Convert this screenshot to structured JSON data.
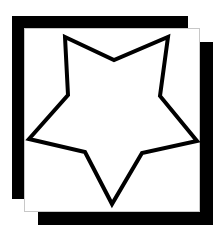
{
  "canvas": {
    "width": 220,
    "height": 235,
    "background": "#ffffff"
  },
  "colors": {
    "frame": "#000000",
    "panel": "#ffffff",
    "panel_outline": "#c8c8c8",
    "star_fill": "#ffffff",
    "star_stroke": "#000000"
  },
  "icon": "star-outline-icon",
  "star": {
    "points": [
      [
        65,
        37
      ],
      [
        114,
        60
      ],
      [
        168,
        37
      ],
      [
        160,
        96
      ],
      [
        197,
        141
      ],
      [
        142,
        153
      ],
      [
        112,
        204
      ],
      [
        85,
        152
      ],
      [
        29,
        139
      ],
      [
        68,
        95
      ]
    ],
    "stroke_width": 4
  }
}
